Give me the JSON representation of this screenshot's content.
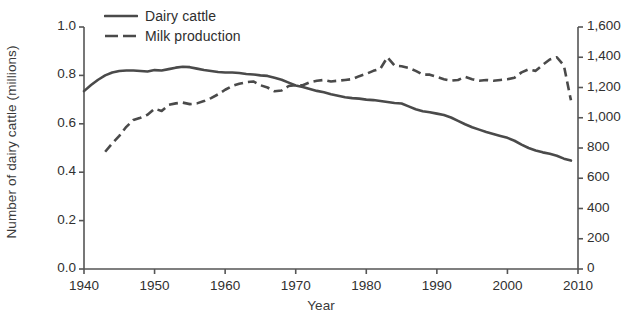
{
  "chart_data": {
    "type": "line",
    "title": "",
    "xlabel": "Year",
    "ylabel": "Number of dairy cattle (millions)",
    "ylabel_right": "Milk production (million litres)",
    "xlim": [
      1940,
      2010
    ],
    "ylim": [
      0.0,
      1.0
    ],
    "ylim_right": [
      0,
      1600
    ],
    "xticks": [
      1940,
      1950,
      1960,
      1970,
      1980,
      1990,
      2000,
      2010
    ],
    "xtick_labels": [
      "1940",
      "1950",
      "1960",
      "1970",
      "1980",
      "1990",
      "2000",
      "2010"
    ],
    "yticks": [
      0.0,
      0.2,
      0.4,
      0.6,
      0.8,
      1.0
    ],
    "ytick_labels": [
      "0.0",
      "0.2",
      "0.4",
      "0.6",
      "0.8",
      "1.0"
    ],
    "yticks_right": [
      0,
      200,
      400,
      600,
      800,
      1000,
      1200,
      1400,
      1600
    ],
    "ytick_labels_right": [
      "0",
      "200",
      "400",
      "600",
      "800",
      "1,000",
      "1,200",
      "1,400",
      "1,600"
    ],
    "grid": false,
    "legend_position": "top-center",
    "line_color": "#4a4a4a",
    "axis_color": "#555555",
    "series": [
      {
        "name": "Dairy cattle",
        "axis": "left",
        "style": "solid",
        "color": "#4a4a4a",
        "x": [
          1940,
          1941,
          1942,
          1943,
          1944,
          1945,
          1946,
          1947,
          1948,
          1949,
          1950,
          1951,
          1952,
          1953,
          1954,
          1955,
          1956,
          1957,
          1958,
          1959,
          1960,
          1961,
          1962,
          1963,
          1964,
          1965,
          1966,
          1967,
          1968,
          1969,
          1970,
          1971,
          1972,
          1973,
          1974,
          1975,
          1976,
          1977,
          1978,
          1979,
          1980,
          1981,
          1982,
          1983,
          1984,
          1985,
          1986,
          1987,
          1988,
          1989,
          1990,
          1991,
          1992,
          1993,
          1994,
          1995,
          1996,
          1997,
          1998,
          1999,
          2000,
          2001,
          2002,
          2003,
          2004,
          2005,
          2006,
          2007,
          2008,
          2009
        ],
        "y": [
          0.735,
          0.76,
          0.782,
          0.8,
          0.812,
          0.818,
          0.82,
          0.82,
          0.818,
          0.816,
          0.822,
          0.82,
          0.826,
          0.832,
          0.836,
          0.834,
          0.828,
          0.822,
          0.818,
          0.814,
          0.812,
          0.812,
          0.81,
          0.806,
          0.804,
          0.8,
          0.798,
          0.79,
          0.782,
          0.77,
          0.758,
          0.752,
          0.744,
          0.736,
          0.73,
          0.722,
          0.716,
          0.71,
          0.706,
          0.704,
          0.7,
          0.698,
          0.694,
          0.69,
          0.686,
          0.684,
          0.672,
          0.66,
          0.652,
          0.648,
          0.642,
          0.636,
          0.626,
          0.612,
          0.598,
          0.586,
          0.576,
          0.566,
          0.558,
          0.55,
          0.542,
          0.53,
          0.514,
          0.5,
          0.49,
          0.482,
          0.476,
          0.468,
          0.456,
          0.448
        ]
      },
      {
        "name": "Milk production",
        "axis": "right",
        "style": "dashed",
        "color": "#4a4a4a",
        "x": [
          1943,
          1944,
          1945,
          1946,
          1947,
          1948,
          1949,
          1950,
          1951,
          1952,
          1953,
          1954,
          1955,
          1956,
          1957,
          1958,
          1959,
          1960,
          1961,
          1962,
          1963,
          1964,
          1965,
          1966,
          1967,
          1968,
          1969,
          1970,
          1971,
          1972,
          1973,
          1974,
          1975,
          1976,
          1977,
          1978,
          1979,
          1980,
          1981,
          1982,
          1983,
          1984,
          1985,
          1986,
          1987,
          1988,
          1989,
          1990,
          1991,
          1992,
          1993,
          1994,
          1995,
          1996,
          1997,
          1998,
          1999,
          2000,
          2001,
          2002,
          2003,
          2004,
          2005,
          2006,
          2007,
          2008,
          2009
        ],
        "y": [
          775,
          830,
          880,
          940,
          985,
          1000,
          1020,
          1060,
          1045,
          1085,
          1095,
          1100,
          1090,
          1095,
          1110,
          1130,
          1155,
          1185,
          1210,
          1225,
          1235,
          1240,
          1215,
          1200,
          1175,
          1180,
          1210,
          1215,
          1215,
          1235,
          1245,
          1250,
          1240,
          1245,
          1250,
          1255,
          1275,
          1290,
          1310,
          1325,
          1400,
          1345,
          1340,
          1330,
          1310,
          1285,
          1285,
          1270,
          1255,
          1245,
          1250,
          1270,
          1255,
          1245,
          1250,
          1245,
          1250,
          1255,
          1265,
          1300,
          1320,
          1310,
          1350,
          1385,
          1400,
          1345,
          1115
        ]
      }
    ]
  },
  "legend": {
    "items": [
      {
        "label": "Dairy cattle",
        "style": "solid"
      },
      {
        "label": "Milk production",
        "style": "dashed"
      }
    ]
  }
}
